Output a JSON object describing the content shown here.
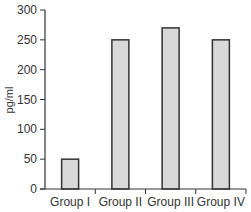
{
  "chart_data": {
    "type": "bar",
    "title": "",
    "xlabel": "",
    "ylabel": "pg/ml",
    "categories": [
      "Group I",
      "Group II",
      "Group III",
      "Group IV"
    ],
    "values": [
      50,
      250,
      270,
      250
    ],
    "ylim": [
      0,
      300
    ],
    "yticks": [
      0,
      50,
      100,
      150,
      200,
      250,
      300
    ],
    "grid": false,
    "legend": null,
    "bar_fill": "#d9d9d9",
    "bar_stroke": "#333333"
  }
}
